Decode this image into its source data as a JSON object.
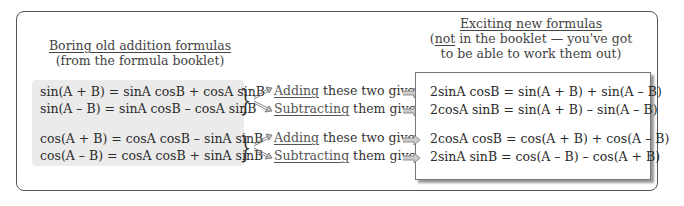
{
  "left_header": {
    "title": "Boring old addition formulas",
    "subtitle": "(from the formula booklet)"
  },
  "right_header": {
    "title": "Exciting new formulas",
    "line2_prefix": "(",
    "line2_underlined": "not",
    "line2_rest": " in the booklet — you've got",
    "line3": "to be able to work them out)"
  },
  "sin_group": {
    "eq1": "sin(A + B) = sinA cosB + cosA sinB",
    "eq2": "sin(A – B) = sinA cosB – cosA sinB",
    "add_label_underlined": "Adding",
    "add_label_rest": " these two gives:",
    "sub_label_underlined": "Subtracting",
    "sub_label_rest": " them gives:",
    "result_add": "2sinA cosB = sin(A + B) + sin(A – B)",
    "result_sub": "2cosA sinB = sin(A + B) – sin(A – B)"
  },
  "cos_group": {
    "eq1": "cos(A + B) = cosA cosB – sinA sinB",
    "eq2": "cos(A – B) = cosA cosB + sinA sinB",
    "add_label_underlined": "Adding",
    "add_label_rest": " these two gives:",
    "sub_label_underlined": "Subtracting",
    "sub_label_rest": " them gives:",
    "result_add": "2cosA cosB = cos(A + B) + cos(A – B)",
    "result_sub": "2sinA sinB = cos(A – B) – cos(A + B)"
  },
  "icons": {
    "brace": "right-curly-brace",
    "diagonal_arrow": "hollow-double-arrow",
    "right_arrow": "hollow-right-arrow"
  },
  "colors": {
    "grey_panel": "#ebebeb",
    "border": "#555555",
    "shadow": "#9a9a9a"
  }
}
